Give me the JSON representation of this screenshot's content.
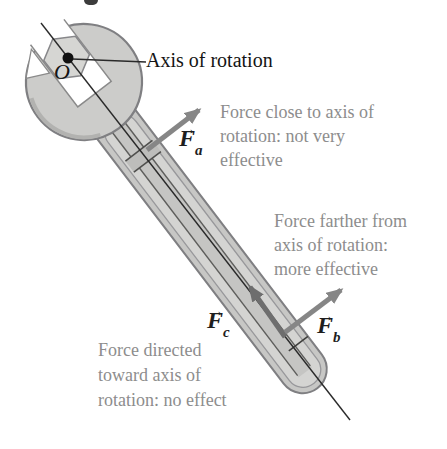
{
  "figure": {
    "axis_label": "Axis of rotation",
    "origin_label": "O",
    "vec_arrow_glyph": "→",
    "forces": {
      "fa": {
        "symbol": "F",
        "sub": "a",
        "caption_lines": [
          "Force close to axis of",
          "rotation: not very",
          "effective"
        ]
      },
      "fb": {
        "symbol": "F",
        "sub": "b",
        "caption_lines": [
          "Force farther from",
          "axis of rotation:",
          "more effective"
        ]
      },
      "fc": {
        "symbol": "F",
        "sub": "c",
        "caption_lines": [
          "Force directed",
          "toward axis of",
          "rotation: no effect"
        ]
      }
    },
    "colors": {
      "wrench_fill": "#ccccca",
      "wrench_inner_fill": "#d4d4d2",
      "wrench_stroke": "#7f7f82",
      "arrow_gray": "#868686",
      "arrow_dark": "#6e6e6e",
      "caption_gray": "#8d8d8d",
      "line_black": "#2a2a2a"
    }
  }
}
